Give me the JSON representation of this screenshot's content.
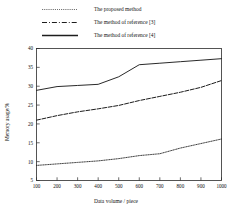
{
  "figure": {
    "background": "#ffffff",
    "line_color": "#1d1d1d",
    "axis_color": "#2b2b2b"
  },
  "legend": {
    "position": "above-axes",
    "entries": [
      {
        "label": "The proposed method",
        "style": "dotted",
        "sample_name": "legend-sample-dotted"
      },
      {
        "label": "The method of reference [3]",
        "style": "dash-dot",
        "sample_name": "legend-sample-dashdot"
      },
      {
        "label": "The method of reference [4]",
        "style": "solid",
        "sample_name": "legend-sample-solid"
      }
    ]
  },
  "axes": {
    "x_title": "Data volume / piece",
    "y_title": "Memory usage/%",
    "x_ticks": [
      "100",
      "200",
      "300",
      "400",
      "500",
      "600",
      "700",
      "800",
      "900",
      "1000"
    ],
    "y_ticks": [
      "5",
      "10",
      "15",
      "20",
      "25",
      "30",
      "35",
      "40"
    ]
  },
  "caption": {
    "sliver_text": ""
  },
  "chart_data": {
    "type": "line",
    "title": "",
    "subtitle": "",
    "xlabel": "Data volume / piece",
    "ylabel": "Memory usage/%",
    "xlim": [
      100,
      1000
    ],
    "ylim": [
      5,
      40
    ],
    "x": [
      100,
      200,
      300,
      400,
      500,
      600,
      700,
      800,
      900,
      1000
    ],
    "grid": false,
    "legend_position": "above-plot",
    "series": [
      {
        "name": "The proposed method",
        "style": "dotted",
        "values": [
          9.0,
          9.4,
          9.8,
          10.2,
          10.8,
          11.6,
          12.1,
          13.6,
          14.8,
          16.0
        ]
      },
      {
        "name": "The method of reference [3]",
        "style": "dash-dot",
        "values": [
          21.0,
          22.2,
          23.2,
          24.0,
          24.9,
          26.2,
          27.3,
          28.4,
          29.7,
          31.5
        ]
      },
      {
        "name": "The method of reference [4]",
        "style": "solid",
        "values": [
          28.9,
          29.9,
          30.2,
          30.5,
          32.5,
          35.7,
          36.1,
          36.5,
          36.9,
          37.3
        ]
      }
    ]
  }
}
